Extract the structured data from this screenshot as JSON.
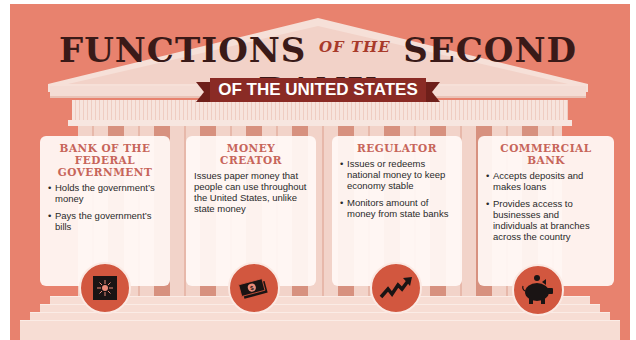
{
  "title": {
    "part1": "FUNCTIONS",
    "connector": "OF THE",
    "part2": "SECOND BANK",
    "banner": "OF THE UNITED STATES"
  },
  "colors": {
    "background": "#e8826e",
    "banner": "#8a2b25",
    "heading": "#c7655a",
    "icon_circle": "#d2573f",
    "title_text": "#3a1a18"
  },
  "cards": [
    {
      "heading": "BANK OF THE FEDERAL GOVERNMENT",
      "bullets": [
        "Holds the government’s money",
        "Pays the government’s bills"
      ],
      "icon": "vault-icon"
    },
    {
      "heading": "MONEY CREATOR",
      "text": "Issues paper money that people can use throughout the United States, unlike state money",
      "icon": "money-stack-icon"
    },
    {
      "heading": "REGULATOR",
      "bullets": [
        "Issues or redeems national money to keep economy stable",
        "Monitors amount of money from state banks"
      ],
      "icon": "trend-arrow-icon"
    },
    {
      "heading": "COMMERCIAL BANK",
      "bullets": [
        "Accepts deposits and makes loans",
        "Provides access to businesses and individuals at branches across the country"
      ],
      "icon": "piggy-bank-icon"
    }
  ]
}
